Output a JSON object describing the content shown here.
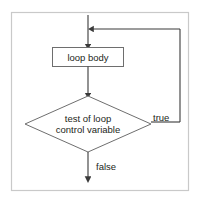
{
  "diagram": {
    "frame": {
      "name": "diagram-frame",
      "stroke_color": "#c9c9c9",
      "fill_color": "#ffffff"
    },
    "colors": {
      "shape_stroke": "#6e6e6e",
      "edge_stroke": "#3a3a3a",
      "text": "#231f20",
      "background": "#ffffff"
    },
    "nodes": [
      {
        "id": "loop-body",
        "type": "process",
        "label": "loop body",
        "x": 88,
        "y": 57,
        "width": 72,
        "height": 19
      },
      {
        "id": "loop-test",
        "type": "decision",
        "label_line_1": "test of loop",
        "label_line_2": "control variable",
        "x": 88,
        "y": 124,
        "width": 126,
        "height": 56
      }
    ],
    "edges": [
      {
        "id": "entry-edge",
        "from": "top",
        "to": "loop-body",
        "label": "",
        "arrow": "down"
      },
      {
        "id": "body-to-test-edge",
        "from": "loop-body",
        "to": "loop-test",
        "label": "",
        "arrow": "down"
      },
      {
        "id": "true-return-edge",
        "from": "loop-test",
        "to": "loop-body-entry",
        "label": "true",
        "arrow": "left"
      },
      {
        "id": "false-exit-edge",
        "from": "loop-test",
        "to": "exit",
        "label": "false",
        "arrow": "down"
      }
    ],
    "labels": {
      "true_label": "true",
      "false_label": "false"
    }
  }
}
